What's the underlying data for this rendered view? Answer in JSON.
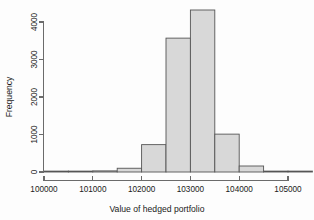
{
  "chart_data": {
    "type": "bar",
    "title": "",
    "subtitle": "",
    "xlabel": "Value of hedged portfolio",
    "ylabel": "Frequency",
    "xlim": [
      100000,
      105500
    ],
    "ylim": [
      0,
      4400
    ],
    "grid": false,
    "legend": null,
    "bin_width": 500,
    "bin_edges": [
      100000,
      100500,
      101000,
      101500,
      102000,
      102500,
      103000,
      103500,
      104000,
      104500,
      105000,
      105500
    ],
    "categories": [
      "100000-100500",
      "100500-101000",
      "101000-101500",
      "101500-102000",
      "102000-102500",
      "102500-103000",
      "103000-103500",
      "103500-104000",
      "104000-104500",
      "104500-105000",
      "105000-105500"
    ],
    "values": [
      0,
      5,
      30,
      100,
      730,
      3570,
      4320,
      1010,
      160,
      20,
      0
    ],
    "xticks": [
      100000,
      101000,
      102000,
      103000,
      104000,
      105000
    ],
    "xticklabels": [
      "100000",
      "101000",
      "102000",
      "103000",
      "104000",
      "105000"
    ],
    "yticks": [
      0,
      1000,
      2000,
      3000,
      4000
    ],
    "yticklabels": [
      "0",
      "1000",
      "2000",
      "3000",
      "4000"
    ],
    "bar_fill_color": "#d8d8d8",
    "bar_edge_color": "#555555",
    "axis_color": "#6b6b6b",
    "background_color": "#fdfdfd"
  },
  "axes": {
    "x_title": "Value of hedged portfolio",
    "y_title": "Frequency"
  }
}
